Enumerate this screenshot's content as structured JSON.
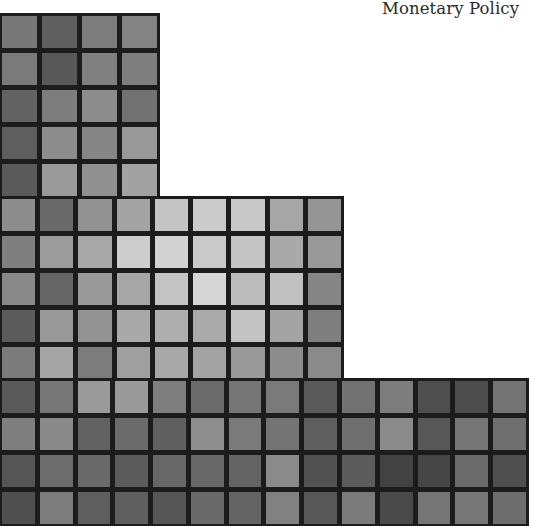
{
  "cover": {
    "title": "Monetary Policy"
  },
  "grid": {
    "line_color": "#1c1c1c",
    "background": "#ffffff",
    "blocks": [
      {
        "name": "top-block",
        "left": 0,
        "top": 13,
        "cols": 4,
        "rows": 5,
        "width": 160,
        "height": 188,
        "cells": [
          [
            "#777777",
            "#5f5f5f",
            "#7c7c7c",
            "#838383"
          ],
          [
            "#7a7a7a",
            "#585858",
            "#808080",
            "#7e7e7e"
          ],
          [
            "#636363",
            "#7d7d7d",
            "#8c8c8c",
            "#727272"
          ],
          [
            "#5e5e5e",
            "#8d8d8d",
            "#868686",
            "#989898"
          ],
          [
            "#5a5a5a",
            "#9a9a9a",
            "#909090",
            "#a2a2a2"
          ]
        ]
      },
      {
        "name": "middle-block",
        "left": 0,
        "top": 196,
        "cols": 9,
        "rows": 5,
        "width": 344,
        "height": 187,
        "cells": [
          [
            "#8d8d8d",
            "#6a6a6a",
            "#929292",
            "#a3a3a3",
            "#c4c4c4",
            "#cbcbcb",
            "#c7c7c7",
            "#a6a6a6",
            "#959595"
          ],
          [
            "#7f7f7f",
            "#9c9c9c",
            "#a8a8a8",
            "#cdcdcd",
            "#d3d3d3",
            "#c9c9c9",
            "#c5c5c5",
            "#a9a9a9",
            "#999999"
          ],
          [
            "#898989",
            "#656565",
            "#999999",
            "#a6a6a6",
            "#c4c4c4",
            "#d6d6d6",
            "#bcbcbc",
            "#c0c0c0",
            "#858585"
          ],
          [
            "#5c5c5c",
            "#989898",
            "#939393",
            "#a9a9a9",
            "#aeaeae",
            "#aaaaaa",
            "#c3c3c3",
            "#a3a3a3",
            "#7f7f7f"
          ],
          [
            "#7b7b7b",
            "#a4a4a4",
            "#7c7c7c",
            "#9f9f9f",
            "#a8a8a8",
            "#a3a3a3",
            "#999999",
            "#8d8d8d",
            "#8a8a8a"
          ]
        ]
      },
      {
        "name": "bottom-block",
        "left": 0,
        "top": 378,
        "cols": 14,
        "rows": 4,
        "width": 529,
        "height": 148,
        "cells": [
          [
            "#5a5a5a",
            "#777777",
            "#9a9a9a",
            "#999999",
            "#7e7e7e",
            "#6b6b6b",
            "#767676",
            "#7a7a7a",
            "#5a5a5a",
            "#727272",
            "#7d7d7d",
            "#4f4f4f",
            "#4d4d4d",
            "#737373"
          ],
          [
            "#7e7e7e",
            "#898989",
            "#626262",
            "#6b6b6b",
            "#5f5f5f",
            "#8e8e8e",
            "#7a7a7a",
            "#747474",
            "#5e5e5e",
            "#6f6f6f",
            "#8a8a8a",
            "#575757",
            "#767676",
            "#6f6f6f"
          ],
          [
            "#565656",
            "#6c6c6c",
            "#6a6a6a",
            "#5c5c5c",
            "#676767",
            "#676767",
            "#646464",
            "#8a8a8a",
            "#515151",
            "#5c5c5c",
            "#424242",
            "#464646",
            "#6b6b6b",
            "#4f4f4f"
          ],
          [
            "#4f4f4f",
            "#7c7c7c",
            "#5e5e5e",
            "#5f5f5f",
            "#565656",
            "#696969",
            "#646464",
            "#818181",
            "#575757",
            "#7b7b7b",
            "#4a4a4a",
            "#757575",
            "#777777",
            "#6d6d6d"
          ]
        ]
      }
    ]
  }
}
